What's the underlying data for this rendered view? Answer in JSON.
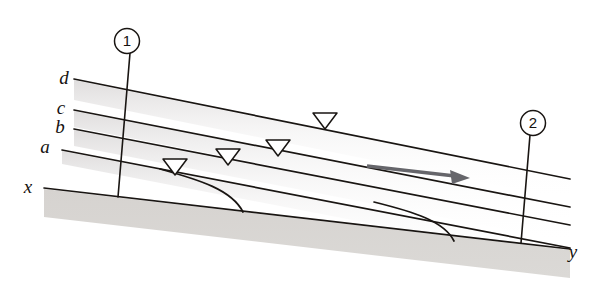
{
  "figure": {
    "kind": "open-channel-flow-profile-diagram",
    "background_color": "#ffffff",
    "line_color": "#191512",
    "bed_fill_color": "#d8d5d2",
    "water_shade_color": "#eceaea",
    "arrow_color": "#66666b",
    "labels": {
      "profile_d": "d",
      "profile_c": "c",
      "profile_b": "b",
      "profile_a": "a",
      "bed_start": "x",
      "bed_end": "y",
      "section_one": "1",
      "section_two": "2"
    },
    "label_positions": {
      "profile_d": {
        "x": 64,
        "y": 84
      },
      "profile_c": {
        "x": 61,
        "y": 114
      },
      "profile_b": {
        "x": 60,
        "y": 133
      },
      "profile_a": {
        "x": 45,
        "y": 153
      },
      "bed_start": {
        "x": 28,
        "y": 193
      },
      "bed_end": {
        "x": 573,
        "y": 258
      },
      "section_one": {
        "x": 127,
        "y": 46
      },
      "section_two": {
        "x": 533,
        "y": 128
      }
    },
    "profile_lines": [
      {
        "name": "d",
        "x1": 74,
        "y1": 79,
        "x2": 570,
        "y2": 179
      },
      {
        "name": "c",
        "x1": 74,
        "y1": 110,
        "x2": 570,
        "y2": 207
      },
      {
        "name": "b",
        "x1": 74,
        "y1": 129,
        "x2": 570,
        "y2": 225
      },
      {
        "name": "a",
        "x1": 62,
        "y1": 150,
        "x2": 570,
        "y2": 248
      },
      {
        "name": "x-y-bed",
        "x1": 44,
        "y1": 188,
        "x2": 570,
        "y2": 249
      }
    ],
    "section_markers": [
      {
        "label": "1",
        "circle_cx": 127,
        "circle_cy": 41,
        "circle_r": 12,
        "x1": 130,
        "y1": 53,
        "x2": 118,
        "y2": 197
      },
      {
        "label": "2",
        "circle_cx": 533,
        "circle_cy": 123,
        "circle_r": 12,
        "x1": 530,
        "y1": 135,
        "x2": 521,
        "y2": 243
      }
    ],
    "free_surface_triangles": [
      {
        "on_line": "a",
        "cx": 175,
        "cy": 167
      },
      {
        "on_line": "b",
        "cx": 228,
        "cy": 157
      },
      {
        "on_line": "c",
        "cx": 278,
        "cy": 148
      },
      {
        "on_line": "d",
        "cx": 325,
        "cy": 121
      }
    ],
    "flow_arrow": {
      "name": "flow-direction-arrow",
      "x1": 367,
      "y1": 166,
      "x2": 468,
      "y2": 178,
      "direction": "downstream-right"
    },
    "transition_curves": [
      {
        "name": "upstream-drawdown-curve",
        "from_line": "a",
        "start_x": 160,
        "start_y": 169,
        "end_x": 245,
        "end_y": 212
      },
      {
        "name": "downstream-drawdown-curve",
        "from_line": "b",
        "start_x": 375,
        "start_y": 202,
        "end_x": 455,
        "end_y": 241
      }
    ],
    "bed": {
      "name": "channel-bed",
      "top_left_x": 44,
      "top_left_y": 188,
      "top_right_x": 570,
      "top_right_y": 249,
      "thickness": 28
    }
  }
}
